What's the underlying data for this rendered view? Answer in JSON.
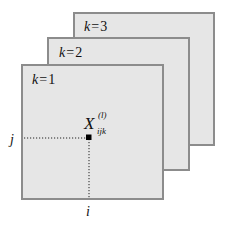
{
  "diagram": {
    "panels": [
      {
        "k_var": "k",
        "eq": "=",
        "k_value": "3"
      },
      {
        "k_var": "k",
        "eq": "=",
        "k_value": "2"
      },
      {
        "k_var": "k",
        "eq": "=",
        "k_value": "1"
      }
    ],
    "element_label": {
      "base": "X",
      "superscript": "(l)",
      "subscript": "ijk"
    },
    "row_axis_label": "j",
    "column_axis_label": "i"
  }
}
